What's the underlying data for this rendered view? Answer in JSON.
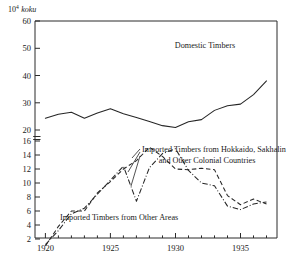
{
  "chart_data": {
    "type": "line",
    "title": "",
    "subtitle": "",
    "xlabel": "",
    "ylabel": "",
    "unit_label": {
      "base": "10",
      "exponent": "4",
      "unit": "koku",
      "full": "10^4 koku"
    },
    "grid": false,
    "legend_position": "inline-annotations",
    "broken_axis": true,
    "axis_break_note": "y-axis is broken between 16 and 20",
    "xlim": [
      1919.2,
      1937.8
    ],
    "x_ticks_major": [
      1920,
      1925,
      1930,
      1935
    ],
    "x_tick_labels": [
      "1920",
      "1925",
      "1930",
      "1935"
    ],
    "x_ticks_minor": [
      1921,
      1922,
      1923,
      1924,
      1926,
      1927,
      1928,
      1929,
      1931,
      1932,
      1933,
      1934,
      1936,
      1937
    ],
    "y_axis_upper": {
      "range": [
        20,
        60
      ],
      "ticks": [
        20,
        30,
        40,
        50,
        60
      ],
      "tick_labels": [
        "20",
        "30",
        "40",
        "50",
        "60"
      ]
    },
    "y_axis_lower": {
      "range": [
        1,
        16
      ],
      "ticks": [
        2,
        4,
        6,
        8,
        10,
        12,
        14,
        16
      ],
      "tick_labels": [
        "2",
        "4",
        "6",
        "8",
        "10",
        "12",
        "14",
        "16"
      ]
    },
    "series": [
      {
        "name": "Domestic Timbers",
        "style": "solid",
        "scale": "upper",
        "x": [
          1920,
          1921,
          1922,
          1923,
          1924,
          1925,
          1926,
          1927,
          1928,
          1929,
          1930,
          1931,
          1932,
          1933,
          1934,
          1935,
          1936,
          1937
        ],
        "values": [
          24.3,
          25.8,
          26.5,
          24.3,
          26.2,
          27.8,
          26.0,
          24.6,
          23.1,
          21.6,
          20.9,
          23.0,
          23.8,
          27.2,
          28.9,
          29.5,
          33.0,
          38.0
        ]
      },
      {
        "name": "Imported Timbers from Hokkaido, Sakhalin and Other Colonial Countries",
        "style": "dash-dot",
        "scale": "lower",
        "x": [
          1920,
          1921,
          1922,
          1923,
          1924,
          1925,
          1926,
          1927,
          1928,
          1929,
          1930,
          1931,
          1932,
          1933,
          1934,
          1935,
          1936,
          1937
        ],
        "values": [
          1.2,
          3.2,
          5.6,
          6.4,
          8.4,
          10.4,
          12.4,
          7.4,
          12.2,
          14.2,
          14.9,
          11.8,
          10.0,
          9.6,
          6.7,
          6.2,
          7.0,
          7.3
        ]
      },
      {
        "name": "Imported Timbers from Other Areas",
        "style": "dashed",
        "scale": "lower",
        "x": [
          1920,
          1921,
          1922,
          1923,
          1924,
          1925,
          1926,
          1927,
          1928,
          1929,
          1930,
          1931,
          1932,
          1933,
          1934,
          1935,
          1936,
          1937
        ],
        "values": [
          1.0,
          3.8,
          6.0,
          6.0,
          8.6,
          10.2,
          12.0,
          13.2,
          15.1,
          13.8,
          12.0,
          11.9,
          12.1,
          11.9,
          8.2,
          6.9,
          7.7,
          7.0
        ]
      }
    ],
    "annotations": [
      {
        "id": "domestic",
        "lines": [
          "Domestic Timbers"
        ],
        "x": 1929.3,
        "y_px": 47
      },
      {
        "id": "colonial",
        "lines": [
          "Imported Timbers from Hokkaido, Sakhalin",
          "and Other Colonial Countries"
        ],
        "x": 1932.0,
        "y_px": 150
      },
      {
        "id": "other-areas",
        "lines": [
          "Imported Timbers from Other Areas"
        ],
        "x": 1926.0,
        "y_px": 217
      }
    ]
  }
}
